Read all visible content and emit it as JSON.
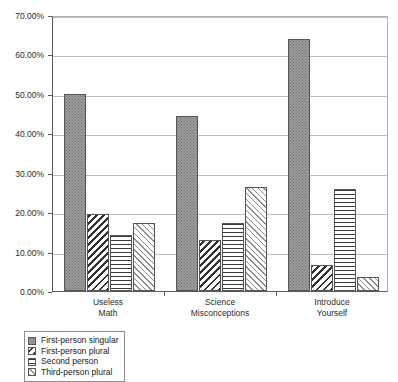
{
  "chart_data": {
    "type": "bar",
    "title": "",
    "subtitle": "",
    "xlabel": "",
    "ylabel": "",
    "grid": true,
    "legend_position": "bottom-left",
    "ylim": [
      0,
      70
    ],
    "ytick_labels": [
      "0.00%",
      "10.00%",
      "20.00%",
      "30.00%",
      "40.00%",
      "50.00%",
      "60.00%",
      "70.00%"
    ],
    "ytick_values": [
      0,
      10,
      20,
      30,
      40,
      50,
      60,
      70
    ],
    "categories": [
      "Useless Math",
      "Science Misconceptions",
      "Introduce Yourself"
    ],
    "category_lines": [
      [
        "Useless",
        "Math"
      ],
      [
        "Science",
        "Misconceptions"
      ],
      [
        "Introduce",
        "Yourself"
      ]
    ],
    "series": [
      {
        "name": "First-person singular",
        "pattern": "dots",
        "color": "#9d9d9d",
        "values": [
          50.0,
          44.4,
          64.0
        ]
      },
      {
        "name": "First-person plural",
        "pattern": "diag-dark",
        "color": "#2f2f2f",
        "values": [
          19.5,
          13.0,
          6.5
        ]
      },
      {
        "name": "Second person",
        "pattern": "horiz",
        "color": "#3a3a3a",
        "values": [
          14.3,
          17.3,
          26.0
        ]
      },
      {
        "name": "Third-person plural",
        "pattern": "diag-light",
        "color": "#8c8c8c",
        "values": [
          17.3,
          26.3,
          3.5
        ]
      }
    ]
  },
  "axis": {
    "grid_color": "#bdbdbd",
    "axis_color": "#5a5a5a"
  }
}
